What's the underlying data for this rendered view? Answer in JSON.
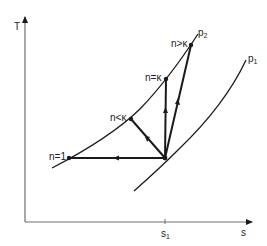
{
  "diagram": {
    "type": "T-s diagram (polytropic compression processes)",
    "axes": {
      "y_label": "T",
      "x_label": "s",
      "x_tick_label": "s",
      "x_tick_subscript": "1"
    },
    "isobars": [
      {
        "name": "p2",
        "label": "p",
        "subscript": "2"
      },
      {
        "name": "p1",
        "label": "p",
        "subscript": "1"
      }
    ],
    "processes": [
      {
        "name": "n=1",
        "label": "n=1"
      },
      {
        "name": "n<k",
        "label": "n<κ"
      },
      {
        "name": "n=k",
        "label": "n=κ"
      },
      {
        "name": "n>k",
        "label": "n>κ"
      }
    ],
    "colors": {
      "line": "#1a1a1a",
      "axis": "#6e6e6e",
      "background": "#ffffff"
    }
  }
}
